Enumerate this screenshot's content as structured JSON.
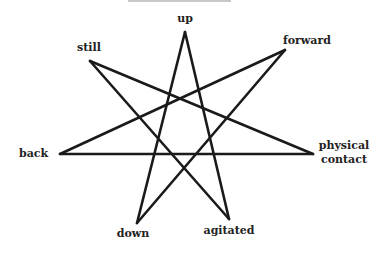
{
  "diagram": {
    "type": "heptagram",
    "shape": "{7/3} star",
    "stroke_color": "#1a1a1a",
    "vertices": [
      {
        "id": "up",
        "label": "up",
        "x": 185,
        "y": 32
      },
      {
        "id": "forward",
        "label": "forward",
        "x": 285,
        "y": 50
      },
      {
        "id": "physical-contact",
        "label_line1": "physical",
        "label_line2": "contact",
        "x": 313,
        "y": 154
      },
      {
        "id": "agitated",
        "label": "agitated",
        "x": 229,
        "y": 219
      },
      {
        "id": "down",
        "label": "down",
        "x": 137,
        "y": 223
      },
      {
        "id": "back",
        "label": "back",
        "x": 60,
        "y": 154
      },
      {
        "id": "still",
        "label": "still",
        "x": 90,
        "y": 61
      }
    ],
    "edges": [
      [
        "up",
        "agitated"
      ],
      [
        "up",
        "down"
      ],
      [
        "forward",
        "down"
      ],
      [
        "forward",
        "back"
      ],
      [
        "physical-contact",
        "back"
      ],
      [
        "physical-contact",
        "still"
      ],
      [
        "agitated",
        "still"
      ]
    ]
  }
}
